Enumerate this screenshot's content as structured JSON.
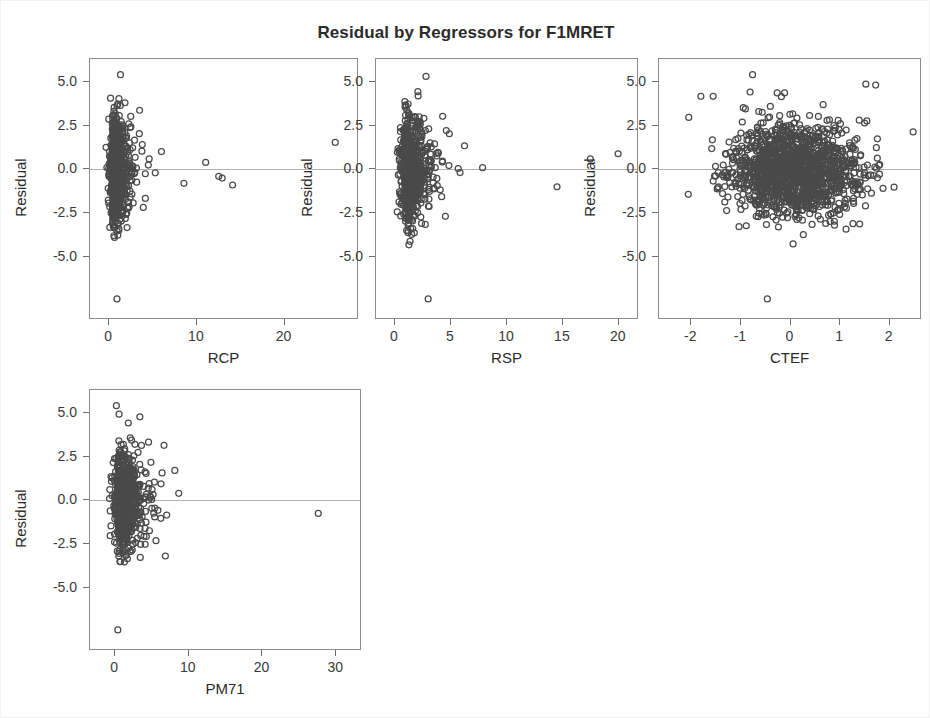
{
  "chart_data": {
    "type": "scatter",
    "title": "Residual by Regressors for F1MRET",
    "layout": {
      "rows": 2,
      "cols": 3,
      "grid": "2x3 panel grid, fourth panel on second row first column",
      "legend": "none",
      "grid_lines": "none",
      "reference_line": "horizontal line at Residual = 0"
    },
    "shared_y": {
      "label": "Residual",
      "ticks": [
        "5.0",
        "2.5",
        "0.0",
        "-2.5",
        "-5.0"
      ],
      "tick_values": [
        5.0,
        2.5,
        0.0,
        -2.5,
        -5.0
      ],
      "ylim": [
        -8.6,
        6.3
      ]
    },
    "marker": {
      "shape": "open-circle",
      "edge_color": "#4a4a4a",
      "fill": "none",
      "size_px": 6
    },
    "panels": [
      {
        "id": "panel-rcp",
        "xlabel": "RCP",
        "ylabel": "Residual",
        "x_ticks": [
          "0",
          "10",
          "20"
        ],
        "x_tick_values": [
          0,
          10,
          20
        ],
        "xlim": [
          -2.2,
          28.5
        ],
        "n_points": 760,
        "cluster": {
          "x_mode": 0.4,
          "x_spread": 0.9,
          "x_skew": "strong right skew",
          "y_mean": -0.1,
          "y_spread": 1.45
        },
        "notable_points": [
          {
            "x": 26.0,
            "y": 1.5
          },
          {
            "x": 11.1,
            "y": 0.35
          },
          {
            "x": 12.6,
            "y": -0.45
          },
          {
            "x": 13.0,
            "y": -0.55
          },
          {
            "x": 14.2,
            "y": -0.95
          },
          {
            "x": 8.6,
            "y": -0.85
          },
          {
            "x": 5.3,
            "y": -0.25
          },
          {
            "x": 4.6,
            "y": 0.55
          },
          {
            "x": 4.5,
            "y": 0.2
          },
          {
            "x": 3.5,
            "y": 3.35
          },
          {
            "x": 1.3,
            "y": 5.4
          },
          {
            "x": 0.9,
            "y": -7.5
          }
        ]
      },
      {
        "id": "panel-rsp",
        "xlabel": "RSP",
        "ylabel": "Residual",
        "x_ticks": [
          "0",
          "5",
          "10",
          "15",
          "20"
        ],
        "x_tick_values": [
          0,
          5,
          10,
          15,
          20
        ],
        "xlim": [
          -1.7,
          21.8
        ],
        "n_points": 760,
        "cluster": {
          "x_mode": 0.9,
          "x_spread": 0.95,
          "x_skew": "strong right skew",
          "y_mean": -0.1,
          "y_spread": 1.45
        },
        "notable_points": [
          {
            "x": 20.1,
            "y": 0.85
          },
          {
            "x": 17.6,
            "y": 0.55
          },
          {
            "x": 14.6,
            "y": -1.05
          },
          {
            "x": 7.9,
            "y": 0.05
          },
          {
            "x": 5.7,
            "y": 0.0
          },
          {
            "x": 4.9,
            "y": 2.0
          },
          {
            "x": 4.3,
            "y": 3.0
          },
          {
            "x": 2.8,
            "y": 5.3
          },
          {
            "x": 3.0,
            "y": -7.5
          }
        ]
      },
      {
        "id": "panel-ctef",
        "xlabel": "CTEF",
        "ylabel": "Residual",
        "x_ticks": [
          "-2",
          "-1",
          "0",
          "1",
          "2"
        ],
        "x_tick_values": [
          -2,
          -1,
          0,
          1,
          2
        ],
        "xlim": [
          -2.65,
          2.65
        ],
        "n_points": 1450,
        "cluster": {
          "x_mode": 0.1,
          "x_spread": 1.05,
          "x_skew": "roughly symmetric, fills panel width",
          "y_mean": -0.1,
          "y_spread": 1.3
        },
        "notable_points": [
          {
            "x": -0.75,
            "y": 5.4
          },
          {
            "x": 1.55,
            "y": 4.85
          },
          {
            "x": 1.75,
            "y": 4.8
          },
          {
            "x": -0.8,
            "y": 4.4
          },
          {
            "x": -0.25,
            "y": 4.35
          },
          {
            "x": -0.1,
            "y": 4.35
          },
          {
            "x": -1.8,
            "y": 4.15
          },
          {
            "x": -1.55,
            "y": 4.15
          },
          {
            "x": -0.45,
            "y": -7.5
          }
        ]
      },
      {
        "id": "panel-pm71",
        "xlabel": "PM71",
        "ylabel": "Residual",
        "x_ticks": [
          "0",
          "10",
          "20",
          "30"
        ],
        "x_tick_values": [
          0,
          10,
          20,
          30
        ],
        "xlim": [
          -3.4,
          33.5
        ],
        "n_points": 760,
        "cluster": {
          "x_mode": 0.5,
          "x_spread": 1.6,
          "x_skew": "strong right skew",
          "y_mean": -0.1,
          "y_spread": 1.45
        },
        "notable_points": [
          {
            "x": 27.8,
            "y": -0.8
          },
          {
            "x": 6.9,
            "y": -3.25
          },
          {
            "x": 6.3,
            "y": 0.9
          },
          {
            "x": 5.4,
            "y": 1.0
          },
          {
            "x": 4.6,
            "y": 3.3
          },
          {
            "x": 2.1,
            "y": 3.55
          },
          {
            "x": 0.2,
            "y": 5.4
          },
          {
            "x": 0.4,
            "y": -7.5
          }
        ]
      }
    ]
  }
}
